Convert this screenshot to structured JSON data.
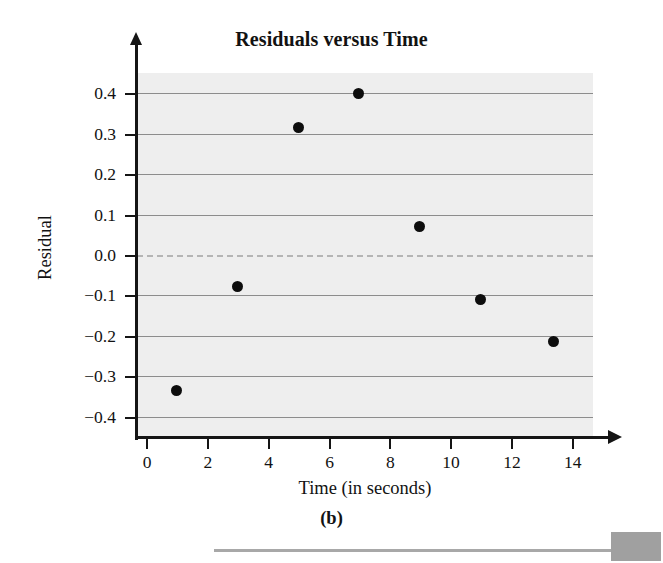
{
  "chart_data": {
    "type": "scatter",
    "title": "Residuals versus Time",
    "xlabel": "Time (in seconds)",
    "ylabel": "Residual",
    "panel_label": "(b)",
    "xlim": [
      -0.3,
      14.7
    ],
    "ylim": [
      -0.45,
      0.45
    ],
    "grid": true,
    "legend": "none",
    "x_ticks": [
      0,
      2,
      4,
      6,
      8,
      10,
      12,
      14
    ],
    "x_tick_labels": [
      "0",
      "2",
      "4",
      "6",
      "8",
      "10",
      "12",
      "14"
    ],
    "y_ticks": [
      0.4,
      0.3,
      0.2,
      0.1,
      0.0,
      -0.1,
      -0.2,
      -0.3,
      -0.4
    ],
    "y_tick_labels": [
      "0.4",
      "0.3",
      "0.2",
      "0.1",
      "0.0",
      "−0.1",
      "−0.2",
      "−0.3",
      "−0.4"
    ],
    "gridlines_y": [
      0.4,
      0.3,
      0.2,
      0.1,
      -0.1,
      -0.2,
      -0.3,
      -0.4
    ],
    "reference_line": {
      "y": 0.0,
      "style": "dashed",
      "color": "#b4b4b4"
    },
    "x": [
      1,
      3,
      5,
      7,
      9,
      11,
      13.4
    ],
    "y": [
      -0.335,
      -0.078,
      0.315,
      0.4,
      0.07,
      -0.11,
      -0.215
    ],
    "points": [
      {
        "x": 1,
        "y": -0.335
      },
      {
        "x": 3,
        "y": -0.078
      },
      {
        "x": 5,
        "y": 0.315
      },
      {
        "x": 7,
        "y": 0.4
      },
      {
        "x": 9,
        "y": 0.07
      },
      {
        "x": 11,
        "y": -0.11
      },
      {
        "x": 13.4,
        "y": -0.215
      }
    ],
    "marker": {
      "shape": "circle",
      "color": "#0d0d0d",
      "size": 11
    },
    "plot_background": "#eeeeee",
    "gridline_color": "#8c8c8c",
    "axis_color": "#151515"
  }
}
